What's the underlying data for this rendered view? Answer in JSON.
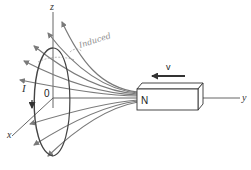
{
  "diagram": {
    "axes": {
      "z_label": "z",
      "y_label": "y",
      "x_label": "x",
      "origin_label": "0"
    },
    "loop": {
      "current_label": "I"
    },
    "magnet": {
      "pole_label": "N",
      "velocity_label": "v"
    },
    "annotation": {
      "handwritten_text": "Induced"
    },
    "colors": {
      "field_lines": "#7a7a7a",
      "loop": "#444444",
      "axes": "#555555",
      "magnet_outline": "#333333",
      "velocity_arrow": "#333333",
      "annotation": "#8a8a8a"
    }
  }
}
